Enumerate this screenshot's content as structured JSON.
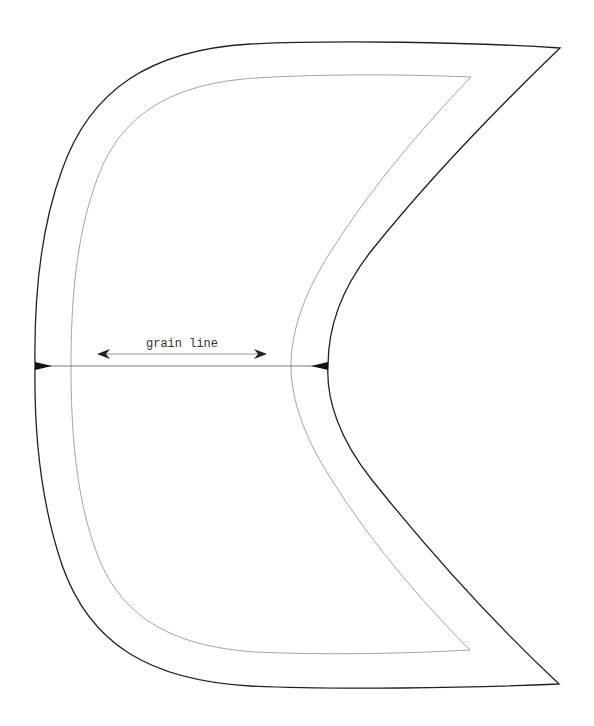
{
  "diagram": {
    "type": "sewing-pattern-piece",
    "background": "#ffffff",
    "cut_line": {
      "color": "#222222",
      "width": 1.3
    },
    "seam_line": {
      "color": "#9a9a9a",
      "width": 0.9
    },
    "grain_line": {
      "label": "grain line",
      "color": "#222222",
      "arrow_color": "#bbbbbb"
    },
    "center_line": {
      "color": "#555555"
    },
    "notches": [
      "left-notch",
      "right-notch"
    ]
  }
}
